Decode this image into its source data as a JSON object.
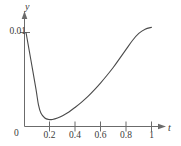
{
  "figure": {
    "kind": "line-plot",
    "background": "#ffffff",
    "curve_color": "#4a4a4a",
    "axis_color": "#6b6b6b",
    "text_color": "#3a3a3a"
  },
  "axes": {
    "x": {
      "label": "t",
      "origin_label": "0",
      "ticks": [
        {
          "value": 0.2,
          "label": "0.2"
        },
        {
          "value": 0.4,
          "label": "0.4"
        },
        {
          "value": 0.6,
          "label": "0.6"
        },
        {
          "value": 0.8,
          "label": "0.8"
        },
        {
          "value": 1.0,
          "label": "1"
        }
      ],
      "range": [
        0,
        1.08
      ]
    },
    "y": {
      "label": "y",
      "ticks": [
        {
          "value": 0.01,
          "label": "0.01"
        }
      ],
      "range": [
        0,
        0.0118
      ]
    }
  },
  "chart_data": {
    "type": "line",
    "title": "",
    "xlabel": "t",
    "ylabel": "y",
    "xlim": [
      0,
      1.08
    ],
    "ylim": [
      0,
      0.0118
    ],
    "grid": false,
    "legend": null,
    "xticks": [
      0.2,
      0.4,
      0.6,
      0.8,
      1
    ],
    "xticklabels": [
      "0.2",
      "0.4",
      "0.6",
      "0.8",
      "1"
    ],
    "yticks": [
      0.01
    ],
    "yticklabels": [
      "0.01"
    ],
    "series": [
      {
        "name": "y(t)",
        "color": "#4a4a4a",
        "x": [
          0.012,
          0.05,
          0.09,
          0.11,
          0.13,
          0.16,
          0.19,
          0.22,
          0.26,
          0.3,
          0.35,
          0.4,
          0.45,
          0.5,
          0.55,
          0.6,
          0.65,
          0.7,
          0.75,
          0.8,
          0.85,
          0.9,
          0.95,
          1.0
        ],
        "y": [
          0.01,
          0.0071,
          0.004,
          0.0023,
          0.0014,
          0.0009,
          0.00075,
          0.00075,
          0.0009,
          0.00115,
          0.00155,
          0.00205,
          0.0026,
          0.0032,
          0.0039,
          0.00465,
          0.00545,
          0.0063,
          0.00725,
          0.0082,
          0.00915,
          0.0099,
          0.01035,
          0.01055
        ]
      }
    ]
  }
}
